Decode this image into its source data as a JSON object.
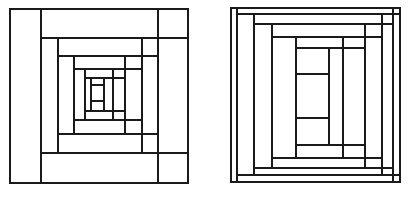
{
  "page": {
    "background_color": "#ffffff",
    "line_color": "#1a1a1a",
    "fill_color": "#ffffff",
    "width": 420,
    "height": 197
  },
  "figures": [
    {
      "id": "left-block",
      "name": "Courthouse Steps Log Cabin Block — Narrow Logs",
      "caption": "",
      "bounds": {
        "x": 10,
        "y": 9,
        "width": 178,
        "height": 174
      },
      "ring_count": 5,
      "description": "Concentric rectangular rings of pieced logs spiralling inward to a small central rectangle.",
      "segments": [
        {
          "name": "outer-border-rect",
          "type": "rect",
          "x": 10,
          "y": 9,
          "width": 178,
          "height": 174,
          "stroke_width": 1.6
        },
        {
          "name": "ring1-left-vertical",
          "type": "line",
          "x1": 41,
          "y1": 9,
          "x2": 41,
          "y2": 183,
          "stroke_width": 1.6
        },
        {
          "name": "ring1-right-vertical",
          "type": "line",
          "x1": 158,
          "y1": 9,
          "x2": 158,
          "y2": 183,
          "stroke_width": 1.6
        },
        {
          "name": "ring1-top-horizontal",
          "type": "line",
          "x1": 41,
          "y1": 38,
          "x2": 188,
          "y2": 38,
          "stroke_width": 1.6
        },
        {
          "name": "ring1-bottom-horizontal",
          "type": "line",
          "x1": 41,
          "y1": 153,
          "x2": 188,
          "y2": 153,
          "stroke_width": 1.6
        },
        {
          "name": "ring2-left-vertical",
          "type": "line",
          "x1": 58,
          "y1": 38,
          "x2": 58,
          "y2": 153,
          "stroke_width": 1.6
        },
        {
          "name": "ring2-right-vertical",
          "type": "line",
          "x1": 142,
          "y1": 38,
          "x2": 142,
          "y2": 153,
          "stroke_width": 1.6
        },
        {
          "name": "ring2-top-horizontal",
          "type": "line",
          "x1": 58,
          "y1": 56,
          "x2": 158,
          "y2": 56,
          "stroke_width": 1.6
        },
        {
          "name": "ring2-bottom-horizontal",
          "type": "line",
          "x1": 58,
          "y1": 134,
          "x2": 158,
          "y2": 134,
          "stroke_width": 1.6
        },
        {
          "name": "ring3-left-vertical",
          "type": "line",
          "x1": 74,
          "y1": 56,
          "x2": 74,
          "y2": 134,
          "stroke_width": 1.6
        },
        {
          "name": "ring3-right-vertical",
          "type": "line",
          "x1": 125,
          "y1": 56,
          "x2": 125,
          "y2": 134,
          "stroke_width": 1.6
        },
        {
          "name": "ring3-top-horizontal",
          "type": "line",
          "x1": 74,
          "y1": 69,
          "x2": 142,
          "y2": 69,
          "stroke_width": 1.6
        },
        {
          "name": "ring3-bottom-horizontal",
          "type": "line",
          "x1": 74,
          "y1": 120,
          "x2": 142,
          "y2": 120,
          "stroke_width": 1.6
        },
        {
          "name": "ring4-left-vertical",
          "type": "line",
          "x1": 85,
          "y1": 69,
          "x2": 85,
          "y2": 120,
          "stroke_width": 1.6
        },
        {
          "name": "ring4-right-vertical",
          "type": "line",
          "x1": 113,
          "y1": 69,
          "x2": 113,
          "y2": 120,
          "stroke_width": 1.6
        },
        {
          "name": "ring4-top-horizontal",
          "type": "line",
          "x1": 85,
          "y1": 78,
          "x2": 125,
          "y2": 78,
          "stroke_width": 1.6
        },
        {
          "name": "ring4-bottom-horizontal",
          "type": "line",
          "x1": 85,
          "y1": 111,
          "x2": 125,
          "y2": 111,
          "stroke_width": 1.6
        },
        {
          "name": "center-block-rect",
          "type": "rect",
          "x": 85,
          "y": 78,
          "width": 19,
          "height": 33,
          "stroke_width": 1.6
        },
        {
          "name": "center-left-vertical",
          "type": "line",
          "x1": 91,
          "y1": 78,
          "x2": 91,
          "y2": 111,
          "stroke_width": 1.6
        },
        {
          "name": "center-top-horizontal",
          "type": "line",
          "x1": 91,
          "y1": 85,
          "x2": 104,
          "y2": 85,
          "stroke_width": 1.6
        },
        {
          "name": "center-bottom-horizontal",
          "type": "line",
          "x1": 91,
          "y1": 101,
          "x2": 104,
          "y2": 101,
          "stroke_width": 1.6
        },
        {
          "name": "center-right-vertical",
          "type": "line",
          "x1": 104,
          "y1": 78,
          "x2": 104,
          "y2": 111,
          "stroke_width": 1.6
        }
      ]
    },
    {
      "id": "right-block",
      "name": "Courthouse Steps Log Cabin Block — Wide Logs",
      "caption": "",
      "bounds": {
        "x": 231,
        "y": 8,
        "width": 169,
        "height": 174
      },
      "ring_count": 5,
      "description": "Concentric rectangular rings with wider logs and a tall rectangular three-part centre.",
      "segments": [
        {
          "name": "outer-border-rect",
          "type": "rect",
          "x": 231,
          "y": 8,
          "width": 169,
          "height": 174,
          "stroke_width": 1.6
        },
        {
          "name": "ring1-left-vertical",
          "type": "line",
          "x1": 237,
          "y1": 8,
          "x2": 237,
          "y2": 182,
          "stroke_width": 1.6
        },
        {
          "name": "ring1-right-vertical",
          "type": "line",
          "x1": 393,
          "y1": 8,
          "x2": 393,
          "y2": 182,
          "stroke_width": 1.6
        },
        {
          "name": "ring1-top-horizontal",
          "type": "line",
          "x1": 237,
          "y1": 14,
          "x2": 400,
          "y2": 14,
          "stroke_width": 1.6
        },
        {
          "name": "ring1-bottom-horizontal",
          "type": "line",
          "x1": 237,
          "y1": 175,
          "x2": 400,
          "y2": 175,
          "stroke_width": 1.6
        },
        {
          "name": "ring2-left-vertical",
          "type": "line",
          "x1": 254,
          "y1": 14,
          "x2": 254,
          "y2": 175,
          "stroke_width": 1.6
        },
        {
          "name": "ring2-right-vertical",
          "type": "line",
          "x1": 382,
          "y1": 14,
          "x2": 382,
          "y2": 175,
          "stroke_width": 1.6
        },
        {
          "name": "ring2-top-horizontal",
          "type": "line",
          "x1": 254,
          "y1": 24,
          "x2": 393,
          "y2": 24,
          "stroke_width": 1.6
        },
        {
          "name": "ring2-bottom-horizontal",
          "type": "line",
          "x1": 254,
          "y1": 168,
          "x2": 393,
          "y2": 168,
          "stroke_width": 1.6
        },
        {
          "name": "ring3-left-vertical",
          "type": "line",
          "x1": 272,
          "y1": 24,
          "x2": 272,
          "y2": 168,
          "stroke_width": 1.6
        },
        {
          "name": "ring3-right-vertical",
          "type": "line",
          "x1": 365,
          "y1": 24,
          "x2": 365,
          "y2": 168,
          "stroke_width": 1.6
        },
        {
          "name": "ring3-top-horizontal",
          "type": "line",
          "x1": 272,
          "y1": 37,
          "x2": 382,
          "y2": 37,
          "stroke_width": 1.6
        },
        {
          "name": "ring3-bottom-horizontal",
          "type": "line",
          "x1": 272,
          "y1": 158,
          "x2": 382,
          "y2": 158,
          "stroke_width": 1.6
        },
        {
          "name": "ring4-left-vertical",
          "type": "line",
          "x1": 296,
          "y1": 37,
          "x2": 296,
          "y2": 158,
          "stroke_width": 1.6
        },
        {
          "name": "ring4-right-vertical",
          "type": "line",
          "x1": 343,
          "y1": 37,
          "x2": 343,
          "y2": 158,
          "stroke_width": 1.6
        },
        {
          "name": "ring4-top-horizontal",
          "type": "line",
          "x1": 296,
          "y1": 48,
          "x2": 365,
          "y2": 48,
          "stroke_width": 1.6
        },
        {
          "name": "ring4-bottom-horizontal",
          "type": "line",
          "x1": 296,
          "y1": 145,
          "x2": 365,
          "y2": 145,
          "stroke_width": 1.6
        },
        {
          "name": "center-block-rect",
          "type": "rect",
          "x": 296,
          "y": 48,
          "width": 33,
          "height": 97,
          "stroke_width": 1.6
        },
        {
          "name": "center-right-vertical",
          "type": "line",
          "x1": 329,
          "y1": 48,
          "x2": 329,
          "y2": 145,
          "stroke_width": 1.6
        },
        {
          "name": "center-top-horizontal",
          "type": "line",
          "x1": 296,
          "y1": 74,
          "x2": 329,
          "y2": 74,
          "stroke_width": 1.6
        },
        {
          "name": "center-bottom-horizontal",
          "type": "line",
          "x1": 296,
          "y1": 118,
          "x2": 329,
          "y2": 118,
          "stroke_width": 1.6
        }
      ]
    }
  ]
}
